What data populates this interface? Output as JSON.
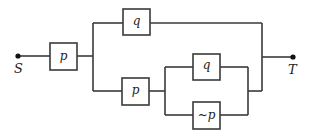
{
  "diagram": {
    "type": "switching-circuit",
    "terminals": {
      "start": {
        "label": "S"
      },
      "end": {
        "label": "T"
      }
    },
    "switches": [
      {
        "id": "sw1",
        "label": "p",
        "position": "series-first"
      },
      {
        "id": "sw2",
        "label": "q",
        "position": "upper-branch"
      },
      {
        "id": "sw3",
        "label": "p",
        "position": "lower-branch-series"
      },
      {
        "id": "sw4",
        "label": "q",
        "position": "lower-inner-parallel-top"
      },
      {
        "id": "sw5",
        "label": "~p",
        "position": "lower-inner-parallel-bottom"
      }
    ],
    "colors": {
      "wire": "#3a3a3a",
      "background": "#ffffff",
      "text": "#222222"
    }
  }
}
